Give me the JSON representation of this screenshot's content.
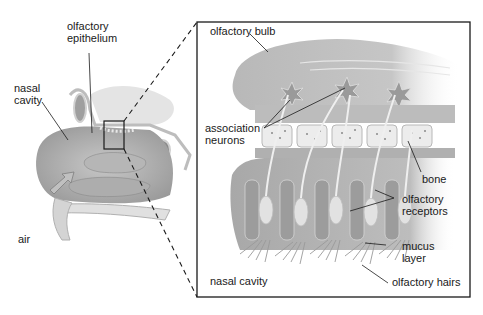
{
  "diagram": {
    "overview_labels": {
      "olfactory_epithelium": "olfactory\nepithelium",
      "nasal_cavity": "nasal\ncavity",
      "air": "air"
    },
    "detail_labels": {
      "olfactory_bulb": "olfactory bulb",
      "association_neurons": "association\nneurons",
      "bone": "bone",
      "olfactory_receptors": "olfactory\nreceptors",
      "mucus_layer": "mucus\nlayer",
      "nasal_cavity": "nasal cavity",
      "olfactory_hairs": "olfactory hairs"
    },
    "colors": {
      "tissue_light": "#d9d9d9",
      "tissue_mid": "#b5b5b5",
      "tissue_dark": "#8f8f8f",
      "line": "#1a1a1a",
      "background": "#ffffff"
    },
    "zoom_box": {
      "x": 104,
      "y": 121,
      "w": 20,
      "h": 28
    },
    "detail_box": {
      "x": 197,
      "y": 22,
      "w": 273,
      "h": 275
    }
  }
}
